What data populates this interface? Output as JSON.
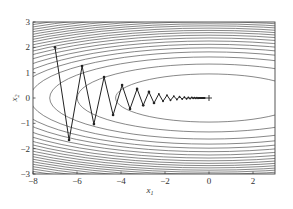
{
  "chart_data": {
    "type": "line",
    "title": "",
    "xlabel": "x1",
    "ylabel": "x2",
    "xlim": [
      -8,
      3
    ],
    "ylim": [
      -3,
      3
    ],
    "grid": false,
    "legend": null,
    "x_ticks": [
      -8,
      -6,
      -4,
      -2,
      0,
      2
    ],
    "y_ticks": [
      -3,
      -2,
      -1,
      0,
      1,
      2,
      3
    ],
    "x_tick_labels": [
      "−8",
      "−6",
      "−4",
      "−2",
      "0",
      "2"
    ],
    "y_tick_labels": [
      "−3",
      "−2",
      "−1",
      "0",
      "1",
      "2",
      "3"
    ],
    "contour": {
      "function": "x1^2/20 + x2^2",
      "center": [
        0,
        0
      ],
      "aspect_ratio_x_over_y": 4.47,
      "x2_intercepts": [
        0.95,
        1.34,
        1.62,
        1.82,
        1.98,
        2.12,
        2.25,
        2.37,
        2.48,
        2.58,
        2.67,
        2.76,
        2.85,
        2.93,
        3.01,
        3.09,
        3.17,
        3.25,
        3.33,
        3.41,
        3.5,
        3.6
      ]
    },
    "series": [
      {
        "name": "gradient descent trajectory",
        "marker": "dot",
        "x": [
          -7.0,
          -6.36,
          -5.77,
          -5.23,
          -4.77,
          -4.36,
          -3.95,
          -3.59,
          -3.27,
          -2.99,
          -2.73,
          -2.5,
          -2.28,
          -2.09,
          -1.91,
          -1.75,
          -1.6,
          -1.46,
          -1.34,
          -1.22,
          -1.12,
          -1.02,
          -0.94,
          -0.86,
          -0.78,
          -0.72,
          -0.66,
          -0.6,
          -0.55,
          -0.5,
          -0.46,
          -0.42,
          -0.38,
          -0.35,
          -0.32,
          -0.29,
          -0.27,
          -0.25,
          -0.22,
          -0.2,
          -0.19
        ],
        "y": [
          2.0,
          -1.66,
          1.26,
          -1.03,
          0.83,
          -0.67,
          0.51,
          -0.43,
          0.36,
          -0.29,
          0.24,
          -0.2,
          0.16,
          -0.13,
          0.11,
          -0.09,
          0.07,
          -0.06,
          0.05,
          -0.04,
          0.03,
          -0.03,
          0.02,
          -0.02,
          0.02,
          -0.01,
          0.01,
          -0.01,
          0.01,
          -0.01,
          0.0,
          0.0,
          0.0,
          0.0,
          0.0,
          0.0,
          0.0,
          0.0,
          0.0,
          0.0,
          0.0
        ]
      }
    ],
    "minimum_marker": {
      "x": 0,
      "y": 0,
      "symbol": "+"
    }
  }
}
